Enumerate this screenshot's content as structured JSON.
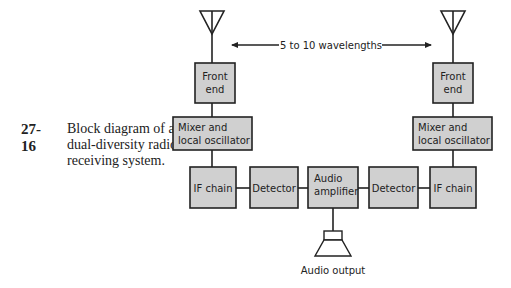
{
  "caption": {
    "figure_number": "27-16",
    "text": "Block diagram of a dual-diversity radio receiving system."
  },
  "diagram": {
    "spacing_label": "5 to 10 wavelengths",
    "left_chain": {
      "front_end": [
        "Front",
        "end"
      ],
      "mixer": [
        "Mixer and",
        "local oscillator"
      ],
      "if_chain": "IF chain",
      "detector": "Detector"
    },
    "right_chain": {
      "front_end": [
        "Front",
        "end"
      ],
      "mixer": [
        "Mixer and",
        "local oscillator"
      ],
      "if_chain": "IF chain",
      "detector": "Detector"
    },
    "audio_amplifier": [
      "Audio",
      "amplifier"
    ],
    "audio_output": "Audio output",
    "colors": {
      "box_fill": "#d0d0d0",
      "stroke": "#222222"
    }
  }
}
